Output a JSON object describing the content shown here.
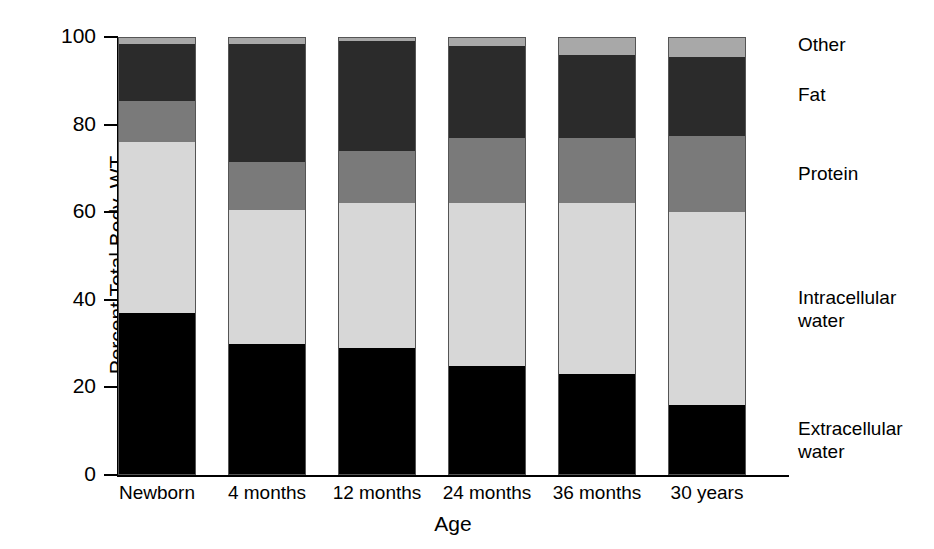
{
  "chart_data": {
    "type": "bar",
    "subtype": "stacked-bar-100",
    "title": "",
    "xlabel": "Age",
    "ylabel": "Percent Total Body, WT",
    "ylim": [
      0,
      100
    ],
    "yticks": [
      0,
      20,
      40,
      60,
      80,
      100
    ],
    "ytick_labels": [
      "0",
      "20",
      "40",
      "60",
      "80",
      "100"
    ],
    "grid": false,
    "legend_position": "right-outside-aligned-to-segments",
    "categories": [
      "Newborn",
      "4 months",
      "12 months",
      "24 months",
      "36 months",
      "30 years"
    ],
    "series": [
      {
        "name": "Extracellular water",
        "color": "#000000",
        "values": [
          37,
          30,
          29,
          25,
          23,
          16
        ]
      },
      {
        "name": "Intracellular water",
        "color": "#d7d7d7",
        "values": [
          39,
          30.5,
          33,
          37,
          39,
          44
        ]
      },
      {
        "name": "Protein",
        "color": "#7a7a7a",
        "values": [
          9.5,
          11,
          12,
          15,
          15,
          17.5
        ]
      },
      {
        "name": "Fat",
        "color": "#2b2b2b",
        "values": [
          13,
          27,
          25,
          21,
          19,
          18
        ]
      },
      {
        "name": "Other",
        "color": "#a8a8a8",
        "values": [
          1.5,
          1.5,
          1,
          2,
          4,
          4.5
        ]
      }
    ]
  },
  "axes": {
    "y_title": "Percent Total Body, WT",
    "x_title": "Age"
  },
  "legend": {
    "entries": [
      {
        "label": "Other"
      },
      {
        "label": "Fat"
      },
      {
        "label": "Protein"
      },
      {
        "label": "Intracellular water"
      },
      {
        "label": "Extracellular water"
      }
    ]
  },
  "colors": {
    "extracellular_water": "#000000",
    "intracellular_water": "#d7d7d7",
    "protein": "#7a7a7a",
    "fat": "#2b2b2b",
    "other": "#a8a8a8",
    "axis": "#000000",
    "background": "#ffffff"
  }
}
